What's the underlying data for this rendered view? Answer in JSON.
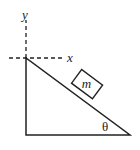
{
  "diagram": {
    "axes": {
      "x_label": "x",
      "y_label": "y"
    },
    "block_label": "m",
    "angle_label": "θ",
    "colors": {
      "stroke": "#222222",
      "background": "#ffffff"
    }
  }
}
